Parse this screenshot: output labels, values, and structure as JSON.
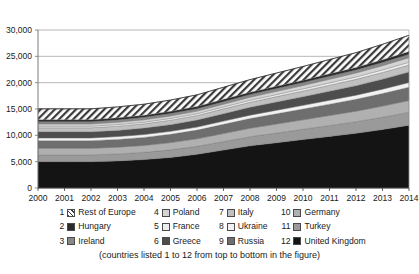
{
  "chart_data": {
    "type": "area",
    "title": "",
    "subtitle": "",
    "xlabel": "",
    "ylabel": "",
    "stacked": true,
    "grid": true,
    "legend_position": "bottom",
    "xlim": [
      2000,
      2014
    ],
    "ylim": [
      0,
      30000
    ],
    "ytick_labels": [
      "30,000",
      "25,000",
      "20,000",
      "15,000",
      "10,000",
      "5,000",
      "0"
    ],
    "ytick_values": [
      30000,
      25000,
      20000,
      15000,
      10000,
      5000,
      0
    ],
    "x": [
      2000,
      2001,
      2002,
      2003,
      2004,
      2005,
      2006,
      2007,
      2008,
      2009,
      2010,
      2011,
      2012,
      2013,
      2014
    ],
    "xtick_labels": [
      "2000",
      "2001",
      "2002",
      "2003",
      "2004",
      "2005",
      "2006",
      "2007",
      "2008",
      "2009",
      "2010",
      "2011",
      "2012",
      "2013",
      "2014"
    ],
    "stack_order_note": "countries listed 1 to 12 from top to bottom in the figure",
    "series": [
      {
        "name": "Rest of Europe",
        "number": 1,
        "swatch": "hatched-diagonal",
        "color": "#e8e8e8",
        "values": [
          2050,
          2050,
          2050,
          2080,
          2100,
          2150,
          2200,
          2300,
          2400,
          2500,
          2600,
          2700,
          2800,
          2950,
          3100
        ]
      },
      {
        "name": "Hungary",
        "number": 2,
        "swatch": "dark-solid",
        "color": "#2b2b2b",
        "values": [
          380,
          380,
          380,
          390,
          400,
          410,
          420,
          430,
          440,
          450,
          460,
          470,
          480,
          490,
          500
        ]
      },
      {
        "name": "Ireland",
        "number": 3,
        "swatch": "mid-gray",
        "color": "#888888",
        "values": [
          430,
          430,
          430,
          440,
          450,
          460,
          470,
          490,
          510,
          530,
          550,
          570,
          590,
          620,
          650
        ]
      },
      {
        "name": "Poland",
        "number": 4,
        "swatch": "light-gray",
        "color": "#d4d4d4",
        "values": [
          430,
          430,
          430,
          440,
          450,
          470,
          490,
          520,
          560,
          600,
          640,
          690,
          740,
          800,
          870
        ]
      },
      {
        "name": "France",
        "number": 5,
        "swatch": "very-light-gray",
        "color": "#ededed",
        "values": [
          300,
          300,
          300,
          310,
          320,
          330,
          340,
          360,
          380,
          400,
          420,
          440,
          460,
          490,
          520
        ]
      },
      {
        "name": "Italy",
        "number": 6,
        "swatch": "light-mid-gray",
        "color": "#c0c0c0",
        "values": [
          780,
          780,
          780,
          800,
          820,
          850,
          880,
          930,
          980,
          1030,
          1080,
          1140,
          1200,
          1270,
          1340
        ]
      },
      {
        "name": "Greece",
        "number": 7,
        "swatch": "dark-gray",
        "color": "#4d4d4d",
        "values": [
          1150,
          1150,
          1150,
          1180,
          1220,
          1270,
          1320,
          1400,
          1480,
          1560,
          1640,
          1720,
          1800,
          1900,
          2000
        ]
      },
      {
        "name": "Ukraine",
        "number": 8,
        "swatch": "very-light",
        "color": "#f2f2f2",
        "values": [
          520,
          520,
          520,
          530,
          540,
          560,
          580,
          610,
          640,
          670,
          700,
          740,
          780,
          830,
          880
        ]
      },
      {
        "name": "Russia",
        "number": 9,
        "swatch": "mid-dark-gray",
        "color": "#6e6e6e",
        "values": [
          1450,
          1450,
          1450,
          1480,
          1520,
          1580,
          1640,
          1740,
          1840,
          1940,
          2040,
          2150,
          2260,
          2390,
          2520
        ]
      },
      {
        "name": "Germany",
        "number": 10,
        "swatch": "light-silver",
        "color": "#b0b0b0",
        "values": [
          1250,
          1250,
          1250,
          1280,
          1320,
          1380,
          1440,
          1530,
          1620,
          1710,
          1800,
          1900,
          2000,
          2120,
          2240
        ]
      },
      {
        "name": "Turkey",
        "number": 11,
        "swatch": "pale-gray",
        "color": "#9a9a9a",
        "values": [
          1290,
          1290,
          1290,
          1320,
          1370,
          1440,
          1510,
          1620,
          1730,
          1840,
          1950,
          2070,
          2190,
          2330,
          2480
        ]
      },
      {
        "name": "United Kingdom",
        "number": 12,
        "swatch": "black-solid",
        "color": "#141414",
        "values": [
          5000,
          5000,
          5000,
          5150,
          5400,
          5800,
          6400,
          7200,
          8000,
          8600,
          9200,
          9800,
          10400,
          11100,
          11900
        ]
      }
    ],
    "totals": [
      15030,
      15030,
      15030,
      15400,
      15910,
      16700,
      17690,
      19130,
      20580,
      21830,
      23080,
      24390,
      25700,
      27290,
      29000
    ],
    "annotations": []
  },
  "legend": {
    "entries": [
      {
        "number": "1",
        "label": "Rest of Europe"
      },
      {
        "number": "4",
        "label": "Poland"
      },
      {
        "number": "7",
        "label": "Italy"
      },
      {
        "number": "10",
        "label": "Germany"
      },
      {
        "number": "2",
        "label": "Hungary"
      },
      {
        "number": "5",
        "label": "France"
      },
      {
        "number": "8",
        "label": "Ukraine"
      },
      {
        "number": "11",
        "label": "Turkey"
      },
      {
        "number": "3",
        "label": "Ireland"
      },
      {
        "number": "6",
        "label": "Greece"
      },
      {
        "number": "9",
        "label": "Russia"
      },
      {
        "number": "12",
        "label": "United Kingdom"
      }
    ]
  },
  "caption": {
    "text": "(countries listed 1 to 12 from top to bottom in the figure)"
  }
}
